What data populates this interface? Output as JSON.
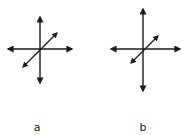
{
  "diagram": {
    "panels": [
      {
        "label": "a",
        "center": [
          40,
          49
        ],
        "vertical": {
          "from": [
            40,
            16
          ],
          "to": [
            40,
            84
          ]
        },
        "horizontal": {
          "from": [
            7,
            49
          ],
          "to": [
            73,
            49
          ]
        },
        "diagonal": {
          "from": [
            22,
            68
          ],
          "to": [
            58,
            32
          ]
        }
      },
      {
        "label": "b",
        "center": [
          143,
          49
        ],
        "vertical": {
          "from": [
            143,
            8
          ],
          "to": [
            143,
            92
          ]
        },
        "horizontal": {
          "from": [
            110,
            49
          ],
          "to": [
            181,
            49
          ]
        },
        "diagonal": {
          "from": [
            130,
            64
          ],
          "to": [
            159,
            35
          ]
        }
      }
    ],
    "stroke_color": "#1a1a1a",
    "background_color": "#ffffff"
  }
}
